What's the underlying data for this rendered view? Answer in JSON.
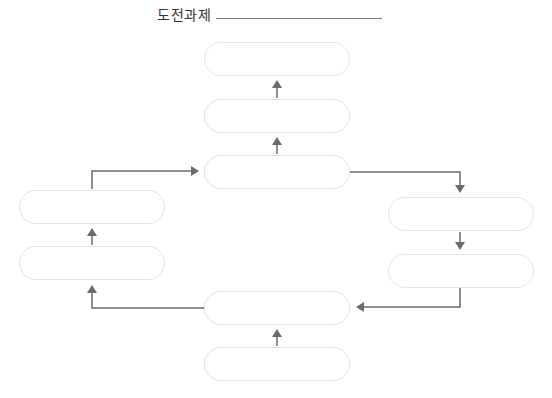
{
  "header": {
    "title": "도전과제",
    "answer_line": ""
  },
  "diagram": {
    "line_color": "#6b6b6b",
    "box_border_color": "#e4e4e4",
    "boxes": [
      {
        "id": "top-1",
        "text": ""
      },
      {
        "id": "top-2",
        "text": ""
      },
      {
        "id": "center",
        "text": ""
      },
      {
        "id": "left-upper",
        "text": ""
      },
      {
        "id": "left-lower",
        "text": ""
      },
      {
        "id": "right-upper",
        "text": ""
      },
      {
        "id": "right-lower",
        "text": ""
      },
      {
        "id": "bottom-upper",
        "text": ""
      },
      {
        "id": "bottom-lower",
        "text": ""
      }
    ]
  }
}
